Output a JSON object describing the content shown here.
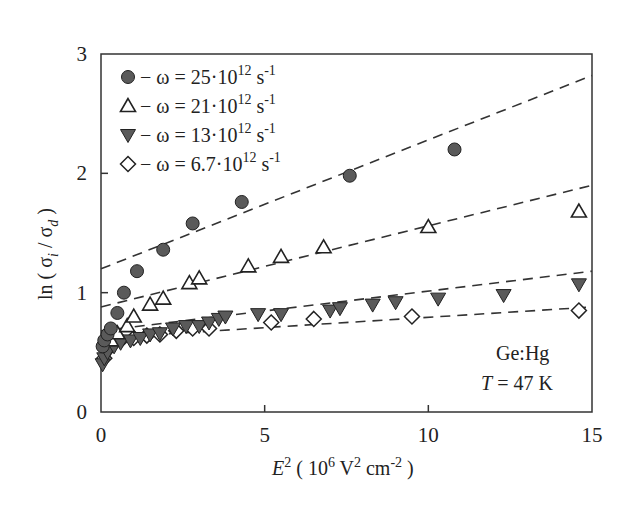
{
  "chart_data": {
    "type": "scatter",
    "title": "",
    "xlabel": "E^2 ( 10^6 V^2 cm^-2 )",
    "ylabel": "ln ( σ_i / σ_d )",
    "xlim": [
      0,
      15
    ],
    "ylim": [
      0,
      3
    ],
    "xticks": [
      0,
      5,
      10,
      15
    ],
    "yticks": [
      0,
      1,
      2,
      3
    ],
    "grid": false,
    "legend_position": "upper-left",
    "annotations": [
      "Ge:Hg",
      "T = 47 K"
    ],
    "series": [
      {
        "name": "ω = 25·10^12 s^-1",
        "marker": "filled-circle",
        "x": [
          0.05,
          0.1,
          0.2,
          0.3,
          0.5,
          0.7,
          1.1,
          1.9,
          2.8,
          4.3,
          7.6,
          10.8
        ],
        "y": [
          0.55,
          0.6,
          0.65,
          0.7,
          0.83,
          1.0,
          1.18,
          1.36,
          1.58,
          1.76,
          1.98,
          2.2
        ],
        "fit_line": {
          "x": [
            0,
            15
          ],
          "y": [
            1.2,
            2.82
          ]
        }
      },
      {
        "name": "ω = 21·10^12 s^-1",
        "marker": "open-triangle-up",
        "x": [
          0.3,
          0.5,
          0.8,
          1.0,
          1.5,
          1.9,
          2.7,
          3.0,
          4.5,
          5.5,
          6.8,
          10.0,
          14.6
        ],
        "y": [
          0.6,
          0.66,
          0.72,
          0.8,
          0.9,
          0.95,
          1.08,
          1.12,
          1.22,
          1.3,
          1.38,
          1.55,
          1.68
        ],
        "fit_line": {
          "x": [
            0,
            15
          ],
          "y": [
            0.88,
            1.9
          ]
        }
      },
      {
        "name": "ω = 13·10^12 s^-1",
        "marker": "filled-triangle-down",
        "x": [
          0.05,
          0.1,
          0.2,
          0.4,
          0.6,
          0.9,
          1.2,
          1.5,
          1.8,
          2.2,
          2.6,
          3.0,
          3.3,
          3.6,
          3.8,
          4.8,
          5.5,
          7.0,
          7.3,
          8.3,
          9.0,
          10.3,
          12.3,
          14.6
        ],
        "y": [
          0.4,
          0.45,
          0.5,
          0.55,
          0.58,
          0.6,
          0.62,
          0.65,
          0.66,
          0.7,
          0.72,
          0.72,
          0.75,
          0.78,
          0.8,
          0.82,
          0.82,
          0.85,
          0.87,
          0.9,
          0.92,
          0.95,
          0.98,
          1.07
        ],
        "fit_line": {
          "x": [
            0,
            15
          ],
          "y": [
            0.68,
            1.18
          ]
        }
      },
      {
        "name": "ω = 6.7·10^12 s^-1",
        "marker": "open-diamond",
        "x": [
          0.1,
          0.3,
          0.6,
          1.0,
          1.4,
          1.8,
          2.3,
          2.8,
          3.3,
          5.2,
          6.5,
          9.5,
          14.6
        ],
        "y": [
          0.45,
          0.55,
          0.6,
          0.62,
          0.64,
          0.65,
          0.68,
          0.7,
          0.7,
          0.75,
          0.78,
          0.8,
          0.85
        ],
        "fit_line": {
          "x": [
            0,
            15
          ],
          "y": [
            0.62,
            0.88
          ]
        }
      }
    ]
  },
  "labels": {
    "y_axis": "ln ( σ",
    "x_axis_prefix": "E",
    "annot_material": "Ge:Hg",
    "annot_temp_T": "T",
    "annot_temp_value": " = 47 K"
  },
  "legend": [
    {
      "prefix": "− ω = 25·10",
      "exp": "12",
      "unit": " s",
      "unit_exp": "-1"
    },
    {
      "prefix": "− ω = 21·10",
      "exp": "12",
      "unit": " s",
      "unit_exp": "-1"
    },
    {
      "prefix": "− ω = 13·10",
      "exp": "12",
      "unit": " s",
      "unit_exp": "-1"
    },
    {
      "prefix": "− ω = 6.7·10",
      "exp": "12",
      "unit": " s",
      "unit_exp": "-1"
    }
  ]
}
